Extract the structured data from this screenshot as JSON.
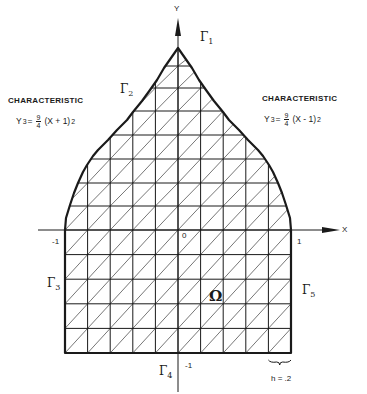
{
  "figure": {
    "axes": {
      "x_label": "X",
      "y_label": "Y",
      "origin_label": "0",
      "x_min_label": "-1",
      "x_max_label": "1",
      "y_min_label": "-1"
    },
    "characteristics": {
      "left": {
        "title": "CHARACTERISTIC",
        "lhs": "Y",
        "lhs_exp": "3",
        "eq": "=",
        "frac_num": "9",
        "frac_den": "4",
        "rhs": "(X + 1)",
        "rhs_exp": "2"
      },
      "right": {
        "title": "CHARACTERISTIC",
        "lhs": "Y",
        "lhs_exp": "3",
        "eq": "=",
        "frac_num": "9",
        "frac_den": "4",
        "rhs": "(X - 1)",
        "rhs_exp": "2"
      }
    },
    "boundaries": {
      "gamma1": {
        "symbol": "Γ",
        "sub": "1"
      },
      "gamma2": {
        "symbol": "Γ",
        "sub": "2"
      },
      "gamma3": {
        "symbol": "Γ",
        "sub": "3"
      },
      "gamma4": {
        "symbol": "Γ",
        "sub": "4"
      },
      "gamma5": {
        "symbol": "Γ",
        "sub": "5"
      }
    },
    "domain_label": "Ω",
    "mesh_size_label": "h = .2",
    "geometry": {
      "x_left": 65,
      "x_right": 291,
      "x_axis_y": 230,
      "y_axis_x": 178,
      "y_bottom": 353,
      "apex": [
        178,
        48
      ],
      "h": 0.2,
      "cols": 10,
      "rows_below": 5,
      "rows_above": [
        206,
        183,
        159,
        135,
        111,
        88,
        66
      ],
      "left_curve": [
        [
          65,
          230
        ],
        [
          66,
          218
        ],
        [
          70,
          205
        ],
        [
          74,
          193
        ],
        [
          78,
          183
        ],
        [
          83,
          172
        ],
        [
          87,
          165
        ],
        [
          93,
          156
        ],
        [
          98,
          150
        ],
        [
          108,
          140
        ],
        [
          117,
          130
        ],
        [
          127,
          120
        ],
        [
          133,
          112
        ],
        [
          142,
          101
        ],
        [
          150,
          90
        ],
        [
          157,
          80
        ],
        [
          164,
          68
        ],
        [
          171,
          58
        ],
        [
          178,
          48
        ]
      ],
      "stroke": "#1a1a1a"
    }
  }
}
